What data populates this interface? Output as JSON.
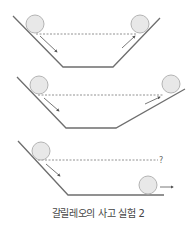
{
  "caption": "갈릴레오의 사고 실험 2",
  "question_mark": "?",
  "colors": {
    "track": "#6e6e6e",
    "ball_fill": "#e8e8e8",
    "ball_stroke": "#b4b4b4",
    "dashed": "#777777",
    "arrow": "#555555"
  },
  "panels": [
    {
      "id": "symmetric-slopes",
      "description": "Ball rolls down left slope and rises to same height on equally steep right slope"
    },
    {
      "id": "gentler-slope",
      "description": "Ball rises to same height on a gentler right slope, travelling farther"
    },
    {
      "id": "flat-surface",
      "description": "Right side is flat; ball never reaches original height and keeps moving"
    }
  ]
}
